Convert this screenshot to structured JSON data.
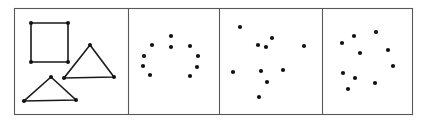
{
  "figure": {
    "width": 425,
    "height": 124,
    "background_color": "#ffffff",
    "frame_color": "#58585a",
    "ink_color": "#111111",
    "panel_count": 4,
    "panel_frame": {
      "x": 14,
      "y": 8,
      "width": 398,
      "height": 106
    },
    "dividers_x": [
      128,
      219,
      322
    ]
  },
  "panels": [
    {
      "id": "panel-1",
      "name": "shapes-panel",
      "kind": "line-shapes",
      "bounds": {
        "x": 14,
        "y": 8,
        "width": 114,
        "height": 106
      },
      "shapes": [
        {
          "name": "square",
          "closed": true,
          "vertices": [
            [
              31,
              23
            ],
            [
              68,
              23
            ],
            [
              68,
              62
            ],
            [
              31,
              62
            ]
          ]
        },
        {
          "name": "right-triangle",
          "closed": true,
          "vertices": [
            [
              90,
              45
            ],
            [
              114,
              77
            ],
            [
              64,
              78
            ]
          ]
        },
        {
          "name": "lower-triangle",
          "closed": true,
          "vertices": [
            [
              51,
              77
            ],
            [
              76,
              100
            ],
            [
              24,
              101
            ]
          ]
        }
      ]
    },
    {
      "id": "panel-2",
      "name": "ring-scatter-panel",
      "kind": "scatter",
      "bounds": {
        "x": 128,
        "y": 8,
        "width": 91,
        "height": 106
      },
      "dot_radius": 2.1,
      "dots": [
        [
          171,
          36
        ],
        [
          152,
          45
        ],
        [
          171,
          47
        ],
        [
          190,
          46
        ],
        [
          144,
          56
        ],
        [
          198,
          56
        ],
        [
          143,
          66
        ],
        [
          197,
          67
        ],
        [
          150,
          75
        ],
        [
          190,
          76
        ]
      ]
    },
    {
      "id": "panel-3",
      "name": "random-scatter-panel-a",
      "kind": "scatter",
      "bounds": {
        "x": 219,
        "y": 8,
        "width": 103,
        "height": 106
      },
      "dot_radius": 2.1,
      "dots": [
        [
          240,
          27
        ],
        [
          272,
          38
        ],
        [
          258,
          45
        ],
        [
          266,
          47
        ],
        [
          304,
          46
        ],
        [
          233,
          72
        ],
        [
          261,
          71
        ],
        [
          283,
          70
        ],
        [
          267,
          82
        ],
        [
          259,
          97
        ]
      ]
    },
    {
      "id": "panel-4",
      "name": "random-scatter-panel-b",
      "kind": "scatter",
      "bounds": {
        "x": 322,
        "y": 8,
        "width": 90,
        "height": 106
      },
      "dot_radius": 2.1,
      "dots": [
        [
          376,
          32
        ],
        [
          354,
          36
        ],
        [
          342,
          43
        ],
        [
          388,
          50
        ],
        [
          360,
          53
        ],
        [
          393,
          66
        ],
        [
          343,
          73
        ],
        [
          355,
          78
        ],
        [
          375,
          83
        ],
        [
          348,
          89
        ]
      ]
    }
  ],
  "chart_data": {
    "type": "scatter",
    "title": "",
    "xlabel": "",
    "ylabel": "",
    "grid": false,
    "legend": "none",
    "series": [
      {
        "name": "panel-1-square-vertices",
        "points": [
          [
            31,
            23
          ],
          [
            68,
            23
          ],
          [
            68,
            62
          ],
          [
            31,
            62
          ]
        ]
      },
      {
        "name": "panel-1-right-triangle-vertices",
        "points": [
          [
            90,
            45
          ],
          [
            114,
            77
          ],
          [
            64,
            78
          ]
        ]
      },
      {
        "name": "panel-1-lower-triangle-vertices",
        "points": [
          [
            51,
            77
          ],
          [
            76,
            100
          ],
          [
            24,
            101
          ]
        ]
      },
      {
        "name": "panel-2-ring-dots",
        "points": [
          [
            171,
            36
          ],
          [
            152,
            45
          ],
          [
            171,
            47
          ],
          [
            190,
            46
          ],
          [
            144,
            56
          ],
          [
            198,
            56
          ],
          [
            143,
            66
          ],
          [
            197,
            67
          ],
          [
            150,
            75
          ],
          [
            190,
            76
          ]
        ]
      },
      {
        "name": "panel-3-scatter-dots",
        "points": [
          [
            240,
            27
          ],
          [
            272,
            38
          ],
          [
            258,
            45
          ],
          [
            266,
            47
          ],
          [
            304,
            46
          ],
          [
            233,
            72
          ],
          [
            261,
            71
          ],
          [
            283,
            70
          ],
          [
            267,
            82
          ],
          [
            259,
            97
          ]
        ]
      },
      {
        "name": "panel-4-scatter-dots",
        "points": [
          [
            376,
            32
          ],
          [
            354,
            36
          ],
          [
            342,
            43
          ],
          [
            388,
            50
          ],
          [
            360,
            53
          ],
          [
            393,
            66
          ],
          [
            343,
            73
          ],
          [
            355,
            78
          ],
          [
            375,
            83
          ],
          [
            348,
            89
          ]
        ]
      }
    ],
    "xlim": [
      0,
      425
    ],
    "ylim": [
      0,
      124
    ]
  }
}
